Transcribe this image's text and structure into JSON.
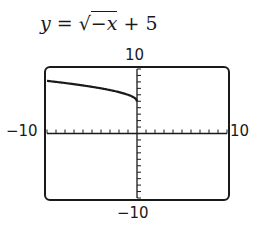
{
  "equation": {
    "lhs": "y",
    "eq": " = ",
    "radical": "√",
    "radicand": "−x",
    "rest": " + 5"
  },
  "window_labels": {
    "ymax": "10",
    "ymin": "−10",
    "xmin": "−10",
    "xmax": "10"
  },
  "chart_data": {
    "type": "line",
    "xlabel": "",
    "ylabel": "",
    "xlim": [
      -10,
      10
    ],
    "ylim": [
      -10,
      10
    ],
    "xscale_ticks": 1,
    "yscale_ticks": 1,
    "grid": false,
    "series": [
      {
        "name": "y = sqrt(-x) + 5",
        "x": [
          -10,
          -9,
          -8,
          -7,
          -6,
          -5,
          -4,
          -3,
          -2,
          -1,
          -0.5,
          0
        ],
        "y": [
          8.16,
          8.0,
          7.83,
          7.65,
          7.45,
          7.24,
          7.0,
          6.73,
          6.41,
          6.0,
          5.71,
          5.0
        ]
      }
    ]
  }
}
